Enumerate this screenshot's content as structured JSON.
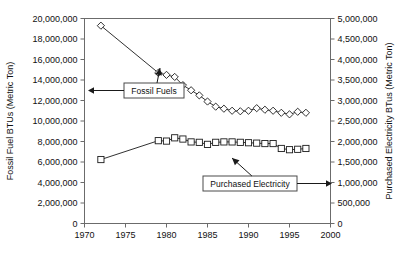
{
  "chart_data": {
    "type": "line",
    "title": "",
    "xlabel": "",
    "xlim": [
      1970,
      2000
    ],
    "x_ticks": [
      1970,
      1975,
      1980,
      1985,
      1990,
      1995,
      2000
    ],
    "x_tick_labels": [
      "1970",
      "1975",
      "1980",
      "1985",
      "1990",
      "1995",
      "2000"
    ],
    "grid": false,
    "legend_position": "annotated-callouts",
    "axes": [
      {
        "id": "left",
        "label": "Fossil Fuel BTUs (Metric Ton)",
        "lim": [
          0,
          20000000
        ],
        "ticks": [
          0,
          2000000,
          4000000,
          6000000,
          8000000,
          10000000,
          12000000,
          14000000,
          16000000,
          18000000,
          20000000
        ],
        "tick_labels": [
          "0",
          "2,000,000",
          "4,000,000",
          "6,000,000",
          "8,000,000",
          "10,000,000",
          "12,000,000",
          "14,000,000",
          "16,000,000",
          "18,000,000",
          "20,000,000"
        ]
      },
      {
        "id": "right",
        "label": "Purchased Electricity BTus (Metric Ton)",
        "lim": [
          0,
          5000000
        ],
        "ticks": [
          0,
          500000,
          1000000,
          1500000,
          2000000,
          2500000,
          3000000,
          3500000,
          4000000,
          4500000,
          5000000
        ],
        "tick_labels": [
          "0",
          "500,000",
          "1,000,000",
          "1,500,000",
          "2,000,000",
          "2,500,000",
          "3,000,000",
          "3,500,000",
          "4,000,000",
          "4,500,000",
          "5,000,000"
        ]
      }
    ],
    "series": [
      {
        "name": "Fossil Fuels",
        "axis": "left",
        "marker": "diamond",
        "x": [
          1972,
          1979,
          1980,
          1981,
          1982,
          1983,
          1984,
          1985,
          1986,
          1987,
          1988,
          1989,
          1990,
          1991,
          1992,
          1993,
          1994,
          1995,
          1996,
          1997
        ],
        "values": [
          19300000,
          14700000,
          14500000,
          14300000,
          13500000,
          13000000,
          12500000,
          11900000,
          11400000,
          11200000,
          11000000,
          10950000,
          11000000,
          11250000,
          11100000,
          11000000,
          10800000,
          10650000,
          10900000,
          10800000
        ]
      },
      {
        "name": "Purchased Electricity",
        "axis": "right",
        "marker": "square",
        "x": [
          1972,
          1979,
          1980,
          1981,
          1982,
          1983,
          1984,
          1985,
          1986,
          1987,
          1988,
          1989,
          1990,
          1991,
          1992,
          1993,
          1994,
          1995,
          1996,
          1997
        ],
        "values": [
          1560000,
          2020000,
          2010000,
          2090000,
          2060000,
          1990000,
          1980000,
          1930000,
          1980000,
          1990000,
          1990000,
          1980000,
          1970000,
          1960000,
          1950000,
          1950000,
          1830000,
          1800000,
          1810000,
          1830000
        ]
      }
    ],
    "annotations": [
      {
        "id": "fossil-fuels-callout",
        "text": "Fossil Fuels",
        "points_to_axis": "left",
        "points_to_series": "Fossil Fuels"
      },
      {
        "id": "purchased-electricity-callout",
        "text": "Purchased Electricity",
        "points_to_axis": "right",
        "points_to_series": "Purchased Electricity"
      }
    ]
  }
}
